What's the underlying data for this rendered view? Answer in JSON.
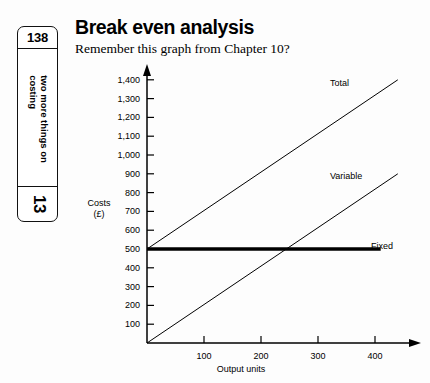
{
  "side_tab": {
    "page_number": "138",
    "running_head_line1": "two more things on",
    "running_head_line2": "costing",
    "chapter_number": "13"
  },
  "heading": {
    "title": "Break even analysis",
    "subtitle": "Remember this graph from Chapter 10?"
  },
  "chart_data": {
    "type": "line",
    "title": "Break even analysis",
    "xlabel": "Output units",
    "ylabel": "Costs\n(£)",
    "ylabel_line1": "Costs",
    "ylabel_line2": "(£)",
    "xlim": [
      0,
      470
    ],
    "ylim": [
      0,
      1450
    ],
    "xticks": [
      100,
      200,
      300,
      400
    ],
    "xtick_labels": [
      "100",
      "200",
      "300",
      "400"
    ],
    "yticks": [
      100,
      200,
      300,
      400,
      500,
      600,
      700,
      800,
      900,
      1000,
      1100,
      1200,
      1300,
      1400
    ],
    "ytick_labels": [
      "100",
      "200",
      "300",
      "400",
      "500",
      "600",
      "700",
      "800",
      "900",
      "1,000",
      "1,100",
      "1,200",
      "1,300",
      "1,400"
    ],
    "grid": false,
    "legend_position": "inline-right",
    "series": [
      {
        "name": "Total",
        "label": "Total",
        "style": "thin",
        "points": [
          [
            0,
            500
          ],
          [
            440,
            1400
          ]
        ],
        "intercept": 500,
        "slope_per_unit": 2.045
      },
      {
        "name": "Variable",
        "label": "Variable",
        "style": "thin",
        "points": [
          [
            0,
            0
          ],
          [
            440,
            900
          ]
        ],
        "intercept": 0,
        "slope_per_unit": 2.045
      },
      {
        "name": "Fixed",
        "label": "Fixed",
        "style": "thick",
        "points": [
          [
            0,
            500
          ],
          [
            410,
            500
          ]
        ],
        "intercept": 500,
        "slope_per_unit": 0
      }
    ],
    "break_even_output_units": 225,
    "break_even_cost": 500,
    "colors": {
      "line": "#000000",
      "axis": "#000000",
      "background": "#ffffff"
    }
  }
}
